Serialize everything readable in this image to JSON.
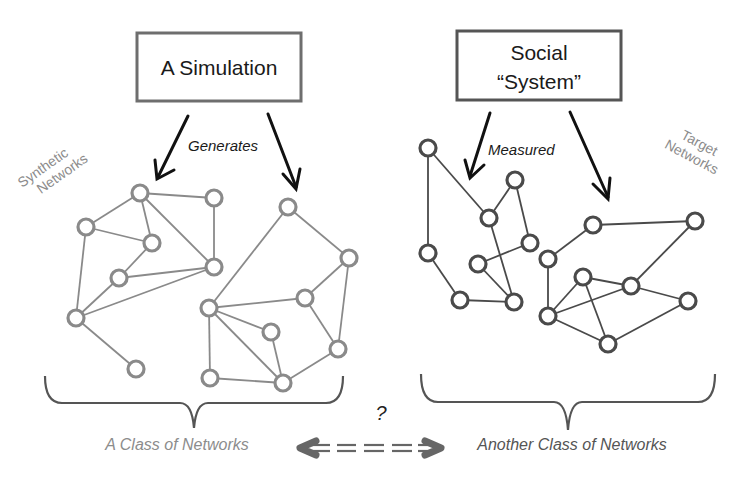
{
  "boxes": {
    "simulation": {
      "label": "A Simulation"
    },
    "social": {
      "line1": "Social",
      "line2": "“System”"
    }
  },
  "verbs": {
    "generates": "Generates",
    "measured": "Measured"
  },
  "tags": {
    "synthetic": {
      "line1": "Synthetic",
      "line2": "Networks"
    },
    "target": {
      "line1": "Target",
      "line2": "Networks"
    }
  },
  "classes": {
    "left": "A Class of Networks",
    "right": "Another Class of Networks",
    "comparison_mark": "?"
  },
  "colors": {
    "synthetic": "#8a8a8a",
    "target": "#4a4a4a",
    "arrow": "#111111",
    "compare_arrow": "#666666",
    "left_label": "#8c8c8c",
    "right_label": "#555555"
  },
  "networks": [
    {
      "name": "synthetic-network-1",
      "style": "gray",
      "nodes": [
        [
          140,
          193
        ],
        [
          214,
          198
        ],
        [
          86,
          227
        ],
        [
          152,
          243
        ],
        [
          119,
          278
        ],
        [
          214,
          267
        ],
        [
          76,
          318
        ],
        [
          136,
          369
        ]
      ],
      "edges": [
        [
          0,
          1
        ],
        [
          0,
          2
        ],
        [
          0,
          3
        ],
        [
          0,
          5
        ],
        [
          1,
          5
        ],
        [
          2,
          3
        ],
        [
          2,
          6
        ],
        [
          3,
          4
        ],
        [
          4,
          5
        ],
        [
          4,
          6
        ],
        [
          6,
          5
        ],
        [
          6,
          7
        ]
      ]
    },
    {
      "name": "synthetic-network-2",
      "style": "gray",
      "nodes": [
        [
          288,
          207
        ],
        [
          349,
          258
        ],
        [
          305,
          298
        ],
        [
          209,
          308
        ],
        [
          271,
          332
        ],
        [
          338,
          349
        ],
        [
          210,
          378
        ],
        [
          283,
          383
        ]
      ],
      "edges": [
        [
          0,
          1
        ],
        [
          0,
          3
        ],
        [
          1,
          2
        ],
        [
          1,
          5
        ],
        [
          2,
          3
        ],
        [
          2,
          5
        ],
        [
          3,
          4
        ],
        [
          3,
          6
        ],
        [
          3,
          7
        ],
        [
          4,
          7
        ],
        [
          6,
          7
        ],
        [
          7,
          5
        ]
      ]
    },
    {
      "name": "target-network-1",
      "style": "dark",
      "nodes": [
        [
          428,
          148
        ],
        [
          515,
          180
        ],
        [
          489,
          218
        ],
        [
          530,
          243
        ],
        [
          428,
          253
        ],
        [
          478,
          264
        ],
        [
          460,
          300
        ],
        [
          514,
          302
        ]
      ],
      "edges": [
        [
          0,
          4
        ],
        [
          0,
          2
        ],
        [
          2,
          1
        ],
        [
          1,
          3
        ],
        [
          2,
          7
        ],
        [
          3,
          5
        ],
        [
          5,
          7
        ],
        [
          4,
          6
        ],
        [
          6,
          7
        ]
      ]
    },
    {
      "name": "target-network-2",
      "style": "dark",
      "nodes": [
        [
          593,
          225
        ],
        [
          695,
          221
        ],
        [
          548,
          259
        ],
        [
          583,
          277
        ],
        [
          631,
          286
        ],
        [
          688,
          301
        ],
        [
          548,
          316
        ],
        [
          608,
          344
        ]
      ],
      "edges": [
        [
          0,
          1
        ],
        [
          0,
          2
        ],
        [
          2,
          6
        ],
        [
          1,
          4
        ],
        [
          3,
          6
        ],
        [
          3,
          4
        ],
        [
          3,
          7
        ],
        [
          4,
          6
        ],
        [
          4,
          5
        ],
        [
          6,
          7
        ],
        [
          7,
          5
        ]
      ]
    }
  ]
}
